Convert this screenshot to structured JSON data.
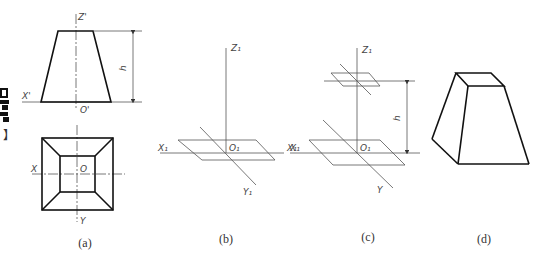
{
  "panels": {
    "a": {
      "caption": "(a)",
      "front_view": {
        "axis_z": "Z'",
        "axis_x": "X'",
        "origin": "O'",
        "height": "h"
      },
      "top_view": {
        "axis_x": "X",
        "axis_y": "Y",
        "origin": "O"
      }
    },
    "b": {
      "caption": "(b)",
      "axis_z": "Z₁",
      "axis_x_left": "X₁",
      "axis_x_right": "X₁",
      "origin": "O₁",
      "axis_y": "Y₁"
    },
    "c": {
      "caption": "(c)",
      "axis_z": "Z₁",
      "axis_x": "X₁",
      "origin": "O₁",
      "axis_y": "Y",
      "height": "h"
    },
    "d": {
      "caption": "(d)"
    }
  },
  "side_marker": {
    "bracket": "】"
  }
}
